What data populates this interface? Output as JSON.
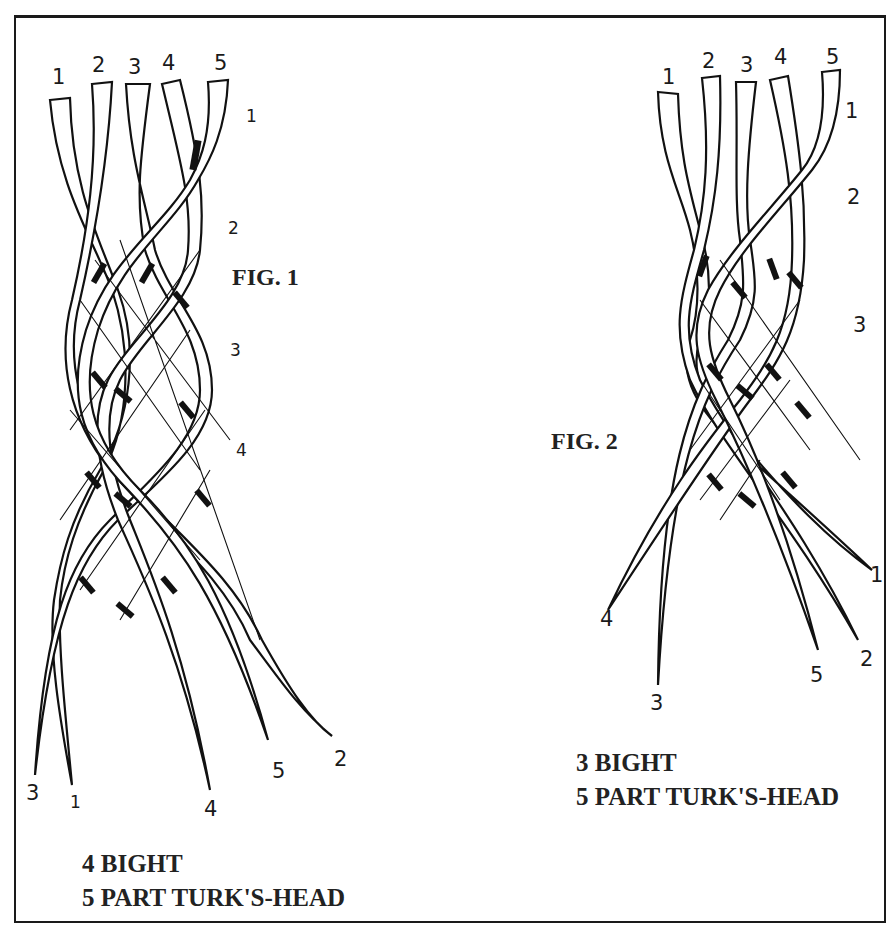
{
  "figures": [
    {
      "id": "fig1",
      "title": "FIG. 1",
      "caption_line1": "4 BIGHT",
      "caption_line2": "5 PART TURK'S-HEAD",
      "top_strand_labels": [
        "1",
        "2",
        "3",
        "4",
        "5"
      ],
      "pass_labels": [
        "1",
        "2",
        "3",
        "4"
      ],
      "end_labels": [
        "3",
        "1",
        "4",
        "5",
        "2"
      ]
    },
    {
      "id": "fig2",
      "title": "FIG. 2",
      "caption_line1": "3 BIGHT",
      "caption_line2": "5 PART TURK'S-HEAD",
      "top_strand_labels": [
        "1",
        "2",
        "3",
        "4",
        "5"
      ],
      "pass_labels": [
        "1",
        "2",
        "3"
      ],
      "end_labels": [
        "4",
        "3",
        "5",
        "2",
        "1"
      ]
    }
  ],
  "colors": {
    "ink": "#111111",
    "paper": "#ffffff"
  }
}
